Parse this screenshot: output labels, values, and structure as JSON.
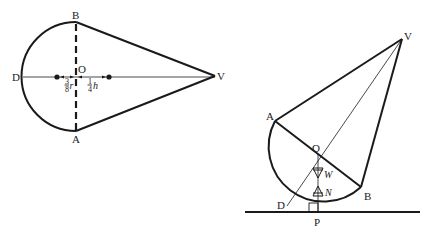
{
  "left_figure": {
    "points": {
      "B": "B",
      "A": "A",
      "D": "D",
      "O": "O",
      "V": "V"
    },
    "annotations": {
      "r_fraction_num": "3",
      "r_fraction_den": "8",
      "r_var": "r",
      "h_fraction_num": "1",
      "h_fraction_den": "4",
      "h_var": "h"
    }
  },
  "right_figure": {
    "points": {
      "V": "V",
      "A": "A",
      "O": "O",
      "B": "B",
      "D": "D",
      "P": "P"
    },
    "forces": {
      "weight": "W",
      "normal": "N"
    }
  },
  "colors": {
    "ink": "#1a1a1a",
    "background": "#ffffff"
  }
}
